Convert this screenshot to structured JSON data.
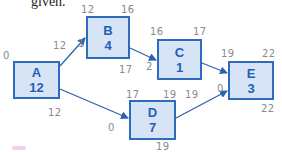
{
  "caption": "given.",
  "colors": {
    "node_fill": "#d6e4f5",
    "node_border": "#2d6bbf",
    "node_text": "#1f5fb8",
    "arrow": "#2d62b0",
    "handwriting": "#8a8a8a"
  },
  "nodes": [
    {
      "id": "A",
      "label": "A",
      "duration": "12"
    },
    {
      "id": "B",
      "label": "B",
      "duration": "4"
    },
    {
      "id": "C",
      "label": "C",
      "duration": "1"
    },
    {
      "id": "D",
      "label": "D",
      "duration": "7"
    },
    {
      "id": "E",
      "label": "E",
      "duration": "3"
    }
  ],
  "edges": [
    {
      "from": "A",
      "to": "B"
    },
    {
      "from": "A",
      "to": "D"
    },
    {
      "from": "B",
      "to": "C"
    },
    {
      "from": "C",
      "to": "E"
    },
    {
      "from": "D",
      "to": "E"
    }
  ],
  "annotations": {
    "A": {
      "early_start": "0",
      "early_finish": "12",
      "late_finish": "12"
    },
    "B": {
      "early_start": "12",
      "early_finish": "16",
      "late_finish": "17",
      "slack": "1"
    },
    "C": {
      "early_start": "16",
      "early_finish": "17",
      "slack": "2"
    },
    "D": {
      "early_start": "17",
      "early_finish": "19",
      "late_finish_top": "19",
      "late_finish": "19",
      "slack": "0"
    },
    "E": {
      "early_start": "19",
      "early_finish": "22",
      "late_finish": "22",
      "slack": "0"
    }
  }
}
